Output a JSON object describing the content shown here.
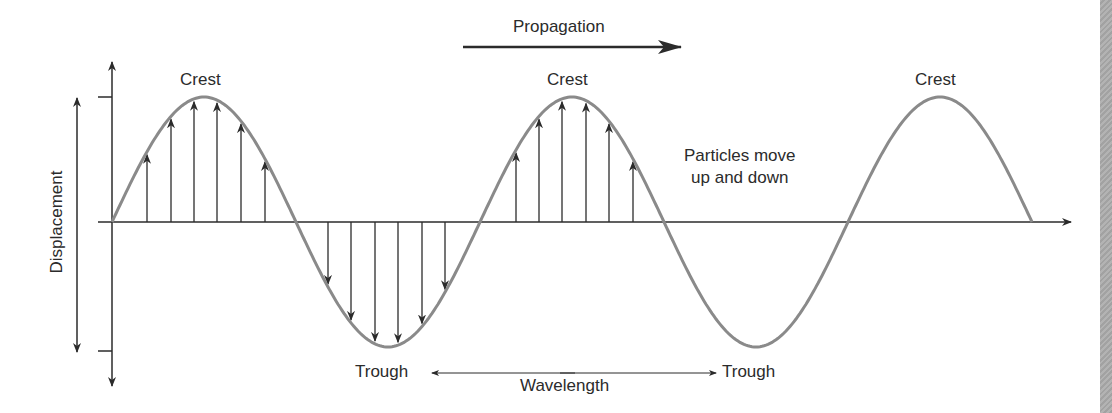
{
  "diagram": {
    "labels": {
      "propagation": "Propagation",
      "crest_1": "Crest",
      "crest_2": "Crest",
      "crest_3": "Crest",
      "trough_1": "Trough",
      "trough_2": "Trough",
      "wavelength": "Wavelength",
      "particles_line1": "Particles move",
      "particles_line2": "up and down",
      "displacement": "Displacement"
    },
    "colors": {
      "wave": "#8a8a8a",
      "ink": "#2b2b2b",
      "strip": "#a9a9a9"
    },
    "geometry": {
      "origin_x": 112,
      "baseline_y": 222,
      "amplitude_px": 125,
      "half_wavelength_px": 184,
      "wave_end_x": 1033
    }
  }
}
